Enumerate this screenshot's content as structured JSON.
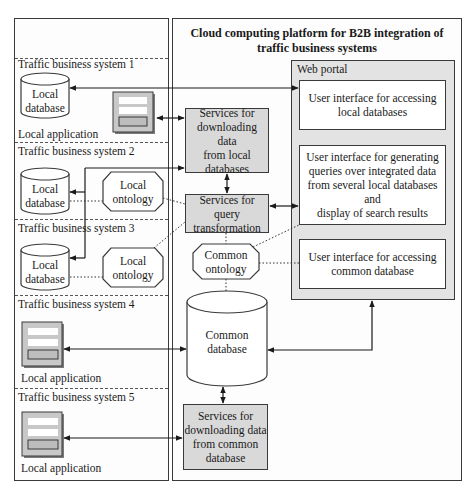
{
  "platform": {
    "title_line1": "Cloud computing platform for B2B integration of",
    "title_line2": "traffic business systems"
  },
  "systems": [
    {
      "label": "Traffic business system 1",
      "components": [
        "Local database",
        "Local application"
      ]
    },
    {
      "label": "Traffic business system 2",
      "components": [
        "Local database",
        "Local ontology"
      ]
    },
    {
      "label": "Traffic business system 3",
      "components": [
        "Local database",
        "Local ontology"
      ]
    },
    {
      "label": "Traffic business system 4",
      "components": [
        "Local application"
      ]
    },
    {
      "label": "Traffic business system 5",
      "components": [
        "Local application"
      ]
    }
  ],
  "labels": {
    "local": "Local",
    "database": "database",
    "ontology": "ontology",
    "local_application": "Local application"
  },
  "services": {
    "download_local": [
      "Services for",
      "downloading data",
      "from local",
      "databases"
    ],
    "query_transform": [
      "Services for query",
      "transformation"
    ],
    "download_common": [
      "Services for",
      "downloading data",
      "from common",
      "database"
    ]
  },
  "common_ontology": [
    "Common",
    "ontology"
  ],
  "common_database": [
    "Common",
    "database"
  ],
  "web_portal": {
    "label": "Web portal",
    "ui_local": [
      "User interface for accessing",
      "local databases"
    ],
    "ui_query": [
      "User interface for generating",
      "queries over integrated data",
      "from several local databases and",
      "display of search results"
    ],
    "ui_common": [
      "User interface for accessing",
      "common database"
    ]
  },
  "colors": {
    "service_fill": "#d9d9d9",
    "portal_fill": "#e3e3e3",
    "stroke": "#3a3a3a"
  }
}
